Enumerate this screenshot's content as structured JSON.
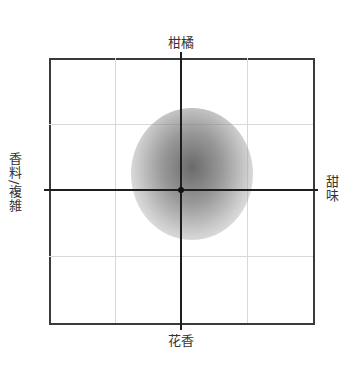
{
  "diagram": {
    "type": "flavor-map",
    "axes": {
      "top": "柑橘",
      "bottom": "花香",
      "left": "香料/複雑",
      "right": "甜味"
    },
    "grid": {
      "divisions": 4
    },
    "colors": {
      "frame": "#3a3a3a",
      "axis": "#1e1e1e",
      "grid": "#d8d8d8",
      "blob": "#6e6e6e"
    },
    "blob": {
      "shape": "circle",
      "center_offset": "slightly up-right of origin",
      "description": "gray gradient flavor profile"
    }
  }
}
